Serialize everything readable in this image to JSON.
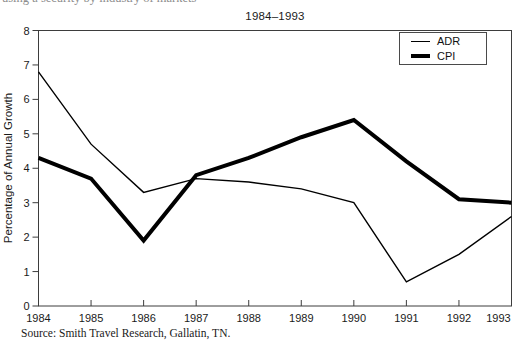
{
  "page": {
    "background": "#ffffff"
  },
  "cropped_text": "using a security by industry of markets",
  "chart_data": {
    "type": "line",
    "title": "1984–1993",
    "ylabel": "Percentage of Annual Growth",
    "x": [
      1984,
      1985,
      1986,
      1987,
      1988,
      1989,
      1990,
      1991,
      1992,
      1993
    ],
    "ylim": [
      0,
      8
    ],
    "ytick_step": 1,
    "grid": false,
    "legend_position": "top-right",
    "line_color": "#000000",
    "frame_color": "#3d3d3d",
    "series": [
      {
        "name": "ADR",
        "stroke_width": 1.4,
        "values": [
          6.8,
          4.7,
          3.3,
          3.7,
          3.6,
          3.4,
          3.0,
          0.7,
          1.5,
          2.6
        ]
      },
      {
        "name": "CPI",
        "stroke_width": 4,
        "values": [
          4.3,
          3.7,
          1.9,
          3.8,
          4.3,
          4.9,
          5.4,
          4.2,
          3.1,
          3.0
        ]
      }
    ]
  },
  "source_note": "Source: Smith Travel Research, Gallatin, TN."
}
